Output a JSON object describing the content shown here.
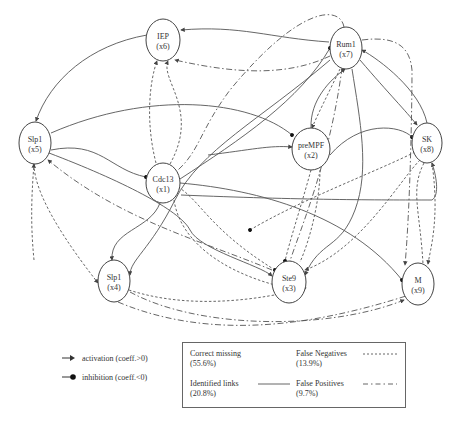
{
  "diagram": {
    "type": "gene-regulatory-network",
    "nodes": [
      {
        "id": "x1",
        "name": "Cdc13",
        "sub": "(x1)",
        "cx": 163,
        "cy": 183,
        "rx": 17,
        "ry": 20
      },
      {
        "id": "x2",
        "name": "preMPF",
        "sub": "(x2)",
        "cx": 311,
        "cy": 149,
        "rx": 19,
        "ry": 21
      },
      {
        "id": "x3",
        "name": "Ste9",
        "sub": "(x3)",
        "cx": 289,
        "cy": 282,
        "rx": 17,
        "ry": 21
      },
      {
        "id": "x4",
        "name": "Slp1",
        "sub": "(x4)",
        "cx": 114,
        "cy": 281,
        "rx": 16,
        "ry": 21
      },
      {
        "id": "x5",
        "name": "Slp1",
        "sub": "(x5)",
        "cx": 35,
        "cy": 143,
        "rx": 16,
        "ry": 21
      },
      {
        "id": "x6",
        "name": "IEP",
        "sub": "(x6)",
        "cx": 163,
        "cy": 40,
        "rx": 17,
        "ry": 21
      },
      {
        "id": "x7",
        "name": "Rum1",
        "sub": "(x7)",
        "cx": 346,
        "cy": 48,
        "rx": 16,
        "ry": 21
      },
      {
        "id": "x8",
        "name": "SK",
        "sub": "(x8)",
        "cx": 427,
        "cy": 143,
        "rx": 15,
        "ry": 20
      },
      {
        "id": "x9",
        "name": "M",
        "sub": "(x9)",
        "cx": 418,
        "cy": 284,
        "rx": 16,
        "ry": 21
      }
    ],
    "edges": [
      {
        "type": "identified",
        "d": "M 329 42 C 270 38, 240 25, 181 30",
        "end": "arrow"
      },
      {
        "type": "identified",
        "d": "M 147 35 C 90 45, 50 80, 36 121",
        "end": "arrow"
      },
      {
        "type": "identified",
        "d": "M 51 133 C 150 90, 250 100, 292 135",
        "end": "dot"
      },
      {
        "type": "identified",
        "d": "M 51 150 C 100 140, 110 170, 146 177",
        "end": "dot"
      },
      {
        "type": "identified",
        "d": "M 49 153 C 120 180, 180 210, 190 230 S 260 265, 272 276",
        "end": "arrow"
      },
      {
        "type": "identified",
        "d": "M 180 183 C 260 190, 350 215, 402 280",
        "end": "dot"
      },
      {
        "type": "identified",
        "d": "M 180 179 C 240 140, 300 100, 330 48",
        "end": "dot"
      },
      {
        "type": "identified",
        "d": "M 160 203 C 150 230, 110 230, 112 260",
        "end": "arrow"
      },
      {
        "type": "identified",
        "d": "M 330 60 C 260 120, 200 150, 175 200 S 130 260, 130 275",
        "end": "arrow"
      },
      {
        "type": "identified",
        "d": "M 208 155 C 250 150, 270 145, 292 147",
        "end": "arrow"
      },
      {
        "type": "identified",
        "d": "M 181 195 C 300 200, 380 200, 432 200 C 440 195, 436 175, 432 163",
        "end": "arrow"
      },
      {
        "type": "identified",
        "d": "M 330 155 C 360 120, 400 125, 412 137",
        "end": "dot"
      },
      {
        "type": "identified",
        "d": "M 311 128 C 310 100, 330 80, 345 69",
        "end": "arrow"
      },
      {
        "type": "identified",
        "d": "M 360 60 C 390 95, 405 110, 417 125",
        "end": "arrow"
      },
      {
        "type": "identified",
        "d": "M 427 123 C 420 90, 380 60, 362 50",
        "end": "arrow"
      },
      {
        "type": "identified",
        "d": "M 352 69 C 360 120, 370 170, 355 210 S 320 240, 305 275",
        "end": "arrow"
      },
      {
        "type": "fn",
        "d": "M 311 170 C 300 210, 290 240, 285 261",
        "end": "dot"
      },
      {
        "type": "fn",
        "d": "M 320 170 C 320 200, 310 240, 300 262",
        "end": "none"
      },
      {
        "type": "fn",
        "d": "M 156 163 C 145 120, 150 80, 157 61",
        "end": "arrow"
      },
      {
        "type": "fn",
        "d": "M 170 164 C 200 110, 160 80, 168 61",
        "end": "arrow"
      },
      {
        "type": "fn",
        "d": "M 178 187 C 200 200, 210 230, 275 270",
        "end": "dot"
      },
      {
        "type": "fn",
        "d": "M 340 69 C 330 90, 315 120, 312 128",
        "end": "arrow"
      },
      {
        "type": "fn",
        "d": "M 415 152 C 380 170, 300 200, 250 230",
        "end": "dot"
      },
      {
        "type": "fn",
        "d": "M 420 160 C 400 180, 360 250, 305 270",
        "end": "arrow"
      },
      {
        "type": "fn",
        "d": "M 432 163 C 440 220, 430 250, 428 264",
        "end": "arrow"
      },
      {
        "type": "fn",
        "d": "M 424 163 C 410 190, 420 210, 423 264",
        "end": "none"
      },
      {
        "type": "fn",
        "d": "M 34 164 C 34 200, 80 260, 98 283",
        "end": "arrow"
      },
      {
        "type": "fn",
        "d": "M 34 260 C 30 220, 32 190, 34 164",
        "end": "arrow"
      },
      {
        "type": "fn",
        "d": "M 129 290 C 190 310, 260 300, 306 288",
        "end": "arrow"
      },
      {
        "type": "fn",
        "d": "M 174 200 C 180 240, 220 270, 275 285",
        "end": "none"
      },
      {
        "type": "fp",
        "d": "M 344 27 C 340 5, 300 5, 230 90 C 200 130, 200 150, 178 170",
        "end": "none"
      },
      {
        "type": "fp",
        "d": "M 362 40 C 400 35, 410 50, 412 70 C 412 110, 410 210, 405 265",
        "end": "arrow"
      },
      {
        "type": "fp",
        "d": "M 130 292 C 200 330, 330 330, 404 300",
        "end": "arrow"
      },
      {
        "type": "fp",
        "d": "M 118 302 C 220 345, 330 320, 406 296",
        "end": "none"
      },
      {
        "type": "fp",
        "d": "M 272 270 C 200 240, 120 220, 48 160",
        "end": "arrow"
      },
      {
        "type": "fp",
        "d": "M 330 56 C 280 80, 220 70, 175 60",
        "end": "arrow"
      },
      {
        "type": "fp",
        "d": "M 342 68 C 330 160, 300 230, 290 261",
        "end": "none"
      }
    ]
  },
  "legend": {
    "arrow_types": [
      {
        "symbol": "arrow",
        "label": "activation (coeff.>0)"
      },
      {
        "symbol": "dot",
        "label": "inhibition (coeff.<0)"
      }
    ],
    "link_types": [
      {
        "name": "Correct missing",
        "pct": "(55.6%)",
        "style": "none"
      },
      {
        "name": "False Negatives",
        "pct": "(13.9%)",
        "style": "dotted"
      },
      {
        "name": "Identified links",
        "pct": "(20.8%)",
        "style": "solid"
      },
      {
        "name": "False Positives",
        "pct": "(9.7%)",
        "style": "dash-dot"
      }
    ]
  },
  "colors": {
    "line": "#555555",
    "node_stroke": "#444444",
    "text": "#333333"
  }
}
